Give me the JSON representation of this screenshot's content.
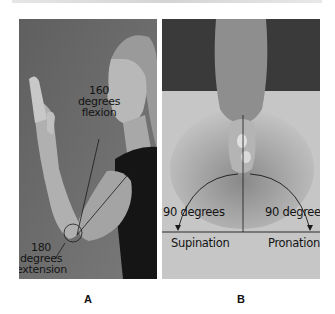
{
  "figure": {
    "panels": [
      {
        "id": "A",
        "caption": "A",
        "labels": {
          "flexion_value": "160",
          "flexion_unit": "degrees",
          "flexion_name": "flexion",
          "extension_value": "180",
          "extension_unit": "degrees",
          "extension_name": "extension"
        }
      },
      {
        "id": "B",
        "caption": "B",
        "labels": {
          "left_angle": "90 degrees",
          "right_angle": "90 degrees",
          "left_motion": "Supination",
          "right_motion": "Pronation"
        }
      }
    ],
    "colors": {
      "panel_a_background": "#6e6e6e",
      "panel_b_background": "#bdbdbd",
      "annotation_line": "#1a1a1a"
    }
  }
}
